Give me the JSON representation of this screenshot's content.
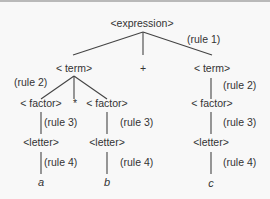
{
  "diagram": {
    "nodes": [
      {
        "id": "expression",
        "label": "<expression>",
        "x": 142,
        "y": 25,
        "kind": "node"
      },
      {
        "id": "term_left",
        "label": "< term>",
        "x": 74,
        "y": 70,
        "kind": "node"
      },
      {
        "id": "plus",
        "label": "+",
        "x": 143,
        "y": 70,
        "kind": "node"
      },
      {
        "id": "term_right",
        "label": "< term>",
        "x": 212,
        "y": 70,
        "kind": "node"
      },
      {
        "id": "factor_a",
        "label": "< factor>",
        "x": 41,
        "y": 105,
        "kind": "node"
      },
      {
        "id": "times",
        "label": "*",
        "x": 75,
        "y": 105,
        "kind": "node"
      },
      {
        "id": "factor_b",
        "label": "< factor>",
        "x": 107,
        "y": 105,
        "kind": "node"
      },
      {
        "id": "factor_c",
        "label": "< factor>",
        "x": 212,
        "y": 105,
        "kind": "node"
      },
      {
        "id": "letter_a",
        "label": "<letter>",
        "x": 41,
        "y": 144,
        "kind": "node"
      },
      {
        "id": "letter_b",
        "label": "<letter>",
        "x": 107,
        "y": 144,
        "kind": "node"
      },
      {
        "id": "letter_c",
        "label": "<letter>",
        "x": 211,
        "y": 144,
        "kind": "node"
      },
      {
        "id": "a",
        "label": "a",
        "x": 41,
        "y": 184,
        "kind": "leaf"
      },
      {
        "id": "b",
        "label": "b",
        "x": 107,
        "y": 184,
        "kind": "leaf"
      },
      {
        "id": "c",
        "label": "c",
        "x": 211,
        "y": 185,
        "kind": "leaf"
      }
    ],
    "edges": [
      {
        "from": "expression",
        "to": "term_left",
        "x1": 143,
        "y1": 30,
        "x2": 73,
        "y2": 53
      },
      {
        "from": "expression",
        "to": "plus",
        "x1": 143,
        "y1": 30,
        "x2": 143,
        "y2": 53
      },
      {
        "from": "expression",
        "to": "term_right",
        "x1": 143,
        "y1": 30,
        "x2": 212,
        "y2": 53
      },
      {
        "from": "term_left",
        "to": "factor_a",
        "x1": 74,
        "y1": 74,
        "x2": 41,
        "y2": 97
      },
      {
        "from": "term_left",
        "to": "times",
        "x1": 74,
        "y1": 74,
        "x2": 74,
        "y2": 97
      },
      {
        "from": "term_left",
        "to": "factor_b",
        "x1": 74,
        "y1": 74,
        "x2": 107,
        "y2": 97
      },
      {
        "from": "term_right",
        "to": "factor_c",
        "x1": 211,
        "y1": 76,
        "x2": 211,
        "y2": 97
      },
      {
        "from": "factor_a",
        "to": "letter_a",
        "x1": 41,
        "y1": 110,
        "x2": 41,
        "y2": 132
      },
      {
        "from": "factor_b",
        "to": "letter_b",
        "x1": 107,
        "y1": 110,
        "x2": 107,
        "y2": 132
      },
      {
        "from": "factor_c",
        "to": "letter_c",
        "x1": 211,
        "y1": 110,
        "x2": 211,
        "y2": 132
      },
      {
        "from": "letter_a",
        "to": "a",
        "x1": 41,
        "y1": 150,
        "x2": 41,
        "y2": 172
      },
      {
        "from": "letter_b",
        "to": "b",
        "x1": 107,
        "y1": 150,
        "x2": 107,
        "y2": 172
      },
      {
        "from": "letter_c",
        "to": "c",
        "x1": 211,
        "y1": 150,
        "x2": 211,
        "y2": 172
      }
    ],
    "rules": [
      {
        "label": "(rule 1)",
        "x": 187,
        "y": 41
      },
      {
        "label": "(rule 2)",
        "x": 14,
        "y": 84
      },
      {
        "label": "(rule 2)",
        "x": 223,
        "y": 87
      },
      {
        "label": "(rule 3)",
        "x": 44,
        "y": 124
      },
      {
        "label": "(rule 3)",
        "x": 120,
        "y": 124
      },
      {
        "label": "(rule 3)",
        "x": 223,
        "y": 124
      },
      {
        "label": "(rule 4)",
        "x": 44,
        "y": 164
      },
      {
        "label": "(rule 4)",
        "x": 120,
        "y": 164
      },
      {
        "label": "(rule 4)",
        "x": 223,
        "y": 164
      }
    ]
  }
}
